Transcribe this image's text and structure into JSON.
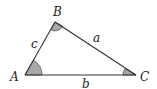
{
  "diagram": {
    "type": "triangle",
    "vertices": {
      "A": {
        "label": "A",
        "x": 25,
        "y": 75
      },
      "B": {
        "label": "B",
        "x": 55,
        "y": 22
      },
      "C": {
        "label": "C",
        "x": 136,
        "y": 75
      }
    },
    "sides": {
      "a": {
        "label": "a",
        "between": [
          "B",
          "C"
        ]
      },
      "b": {
        "label": "b",
        "between": [
          "A",
          "C"
        ]
      },
      "c": {
        "label": "c",
        "between": [
          "A",
          "B"
        ]
      }
    },
    "angle_marks": [
      "A",
      "B",
      "C"
    ],
    "colors": {
      "line": "#333333",
      "angle_fill": "#a8a8a8",
      "label": "#222222",
      "background": "#ffffff"
    }
  }
}
